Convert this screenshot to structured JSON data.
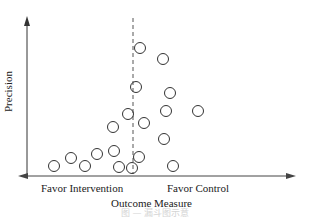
{
  "chart_data": {
    "type": "scatter",
    "title": "",
    "chart_kind": "funnel plot",
    "xlabel": "Outcome Measure",
    "ylabel": "Precision",
    "x_annotations": {
      "left": "Favor Intervention",
      "right": "Favor Control"
    },
    "reference_line": {
      "style": "dashed",
      "orientation": "vertical",
      "x_px": 133
    },
    "grid": false,
    "legend": null,
    "marker": "open-circle",
    "points_px": [
      {
        "x": 140,
        "y": 48
      },
      {
        "x": 163,
        "y": 59
      },
      {
        "x": 136,
        "y": 87
      },
      {
        "x": 170,
        "y": 93
      },
      {
        "x": 128,
        "y": 114
      },
      {
        "x": 166,
        "y": 111
      },
      {
        "x": 198,
        "y": 111
      },
      {
        "x": 144,
        "y": 123
      },
      {
        "x": 113,
        "y": 127
      },
      {
        "x": 164,
        "y": 139
      },
      {
        "x": 114,
        "y": 151
      },
      {
        "x": 139,
        "y": 157
      },
      {
        "x": 97,
        "y": 154
      },
      {
        "x": 71,
        "y": 158
      },
      {
        "x": 54,
        "y": 166
      },
      {
        "x": 85,
        "y": 166
      },
      {
        "x": 119,
        "y": 167
      },
      {
        "x": 132,
        "y": 168
      },
      {
        "x": 173,
        "y": 166
      }
    ]
  },
  "labels": {
    "ylabel": "Precision",
    "xlabel": "Outcome Measure",
    "favor_left": "Favor Intervention",
    "favor_right": "Favor Control",
    "caption": "图 — 漏斗图示意"
  }
}
